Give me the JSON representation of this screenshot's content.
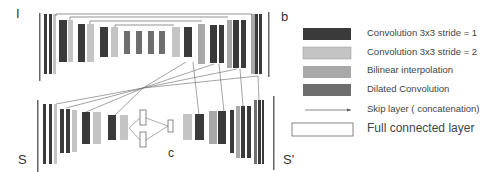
{
  "labels": {
    "input_top": "I",
    "output_top": "b",
    "input_bottom": "S",
    "center": "c",
    "output_bottom": "S'"
  },
  "colors": {
    "conv_stride1": "#3a3a3a",
    "conv_stride2": "#c4c4c4",
    "bilinear": "#a8a8a8",
    "dilated": "#6e6e6e",
    "skip": "#555555",
    "fc": "#ffffff"
  },
  "legend": [
    {
      "type": "conv_stride1",
      "label": "Convolution 3x3 stride = 1"
    },
    {
      "type": "conv_stride2",
      "label": "Convolution 3x3 stride = 2"
    },
    {
      "type": "bilinear",
      "label": "Bilinear interpolation"
    },
    {
      "type": "dilated",
      "label": "Dilated Convolution"
    },
    {
      "type": "skip",
      "label": "Skip layer ( concatenation)"
    },
    {
      "type": "fc",
      "label": "Full connected layer"
    }
  ]
}
